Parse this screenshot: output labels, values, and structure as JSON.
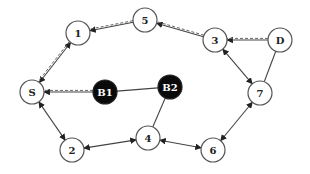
{
  "diagram": {
    "type": "network-graph",
    "nodes": [
      {
        "id": "S",
        "label": "S",
        "x": 32,
        "y": 92,
        "style": "white"
      },
      {
        "id": "1",
        "label": "1",
        "x": 78,
        "y": 33,
        "style": "white"
      },
      {
        "id": "5",
        "label": "5",
        "x": 145,
        "y": 20,
        "style": "white"
      },
      {
        "id": "3",
        "label": "3",
        "x": 215,
        "y": 40,
        "style": "white"
      },
      {
        "id": "D",
        "label": "D",
        "x": 280,
        "y": 40,
        "style": "white"
      },
      {
        "id": "7",
        "label": "7",
        "x": 260,
        "y": 93,
        "style": "white"
      },
      {
        "id": "6",
        "label": "6",
        "x": 213,
        "y": 150,
        "style": "white"
      },
      {
        "id": "4",
        "label": "4",
        "x": 148,
        "y": 138,
        "style": "white"
      },
      {
        "id": "2",
        "label": "2",
        "x": 72,
        "y": 150,
        "style": "white"
      },
      {
        "id": "B1",
        "label": "B1",
        "x": 105,
        "y": 92,
        "style": "black"
      },
      {
        "id": "B2",
        "label": "B2",
        "x": 170,
        "y": 87,
        "style": "black"
      }
    ],
    "edges": [
      {
        "from": "D",
        "to": "3",
        "kind": "solid+dashed",
        "arrow": "to"
      },
      {
        "from": "3",
        "to": "5",
        "kind": "solid+dashed",
        "arrow": "to"
      },
      {
        "from": "5",
        "to": "1",
        "kind": "solid+dashed",
        "arrow": "to"
      },
      {
        "from": "1",
        "to": "S",
        "kind": "solid+dashed",
        "arrow": "both"
      },
      {
        "from": "B1",
        "to": "S",
        "kind": "solid+dashed",
        "arrow": "to"
      },
      {
        "from": "B1",
        "to": "B2",
        "kind": "solid",
        "arrow": "none"
      },
      {
        "from": "B2",
        "to": "4",
        "kind": "solid",
        "arrow": "none"
      },
      {
        "from": "S",
        "to": "2",
        "kind": "solid",
        "arrow": "both"
      },
      {
        "from": "2",
        "to": "4",
        "kind": "solid",
        "arrow": "both"
      },
      {
        "from": "4",
        "to": "6",
        "kind": "solid",
        "arrow": "both"
      },
      {
        "from": "6",
        "to": "7",
        "kind": "solid",
        "arrow": "both"
      },
      {
        "from": "3",
        "to": "7",
        "kind": "solid",
        "arrow": "both"
      },
      {
        "from": "D",
        "to": "7",
        "kind": "solid",
        "arrow": "none"
      }
    ]
  }
}
